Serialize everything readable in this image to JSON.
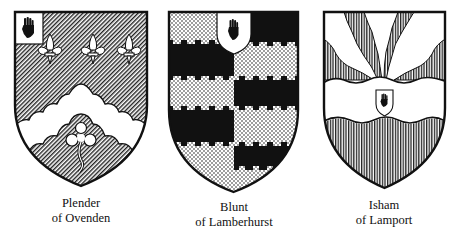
{
  "figure": {
    "shields": [
      {
        "id": "plender",
        "caption_line1": "Plender",
        "caption_line2": "of Ovenden",
        "charges": [
          "canton-with-red-hand",
          "three-fleurs-de-lis",
          "engrailed-chevron",
          "trefoil-slipped"
        ],
        "tinctures": [
          "diagonal-hatching",
          "white"
        ]
      },
      {
        "id": "blunt",
        "caption_line1": "Blunt",
        "caption_line2": "of Lamberhurst",
        "charges": [
          "escutcheon-with-red-hand",
          "barry-nebuly-embattled",
          "per-pale-counterchanged"
        ],
        "tinctures": [
          "dotted",
          "black"
        ]
      },
      {
        "id": "isham",
        "caption_line1": "Isham",
        "caption_line2": "of Lamport",
        "charges": [
          "wavy-fess",
          "escutcheon-with-red-hand",
          "piles-wavy"
        ],
        "tinctures": [
          "vertical-hatching",
          "white"
        ]
      }
    ]
  },
  "colors": {
    "ink": "#111111",
    "paper": "#ffffff"
  }
}
